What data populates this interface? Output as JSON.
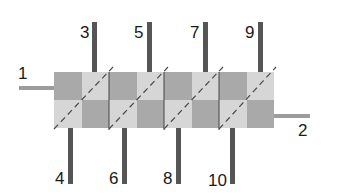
{
  "diagram": {
    "colors": {
      "dark_cell": "#a9a9a9",
      "light_cell": "#d6d6d6",
      "pin": "#555555",
      "lead": "#9c9c9c",
      "separator": "#444444",
      "dash": "#4a4a4a",
      "label": "#1a1a1a"
    },
    "blocks": [
      {
        "index": 1,
        "x": 54
      },
      {
        "index": 2,
        "x": 109
      },
      {
        "index": 3,
        "x": 164
      },
      {
        "index": 4,
        "x": 219
      }
    ],
    "leads": {
      "input": {
        "label": "1"
      },
      "output": {
        "label": "2"
      }
    },
    "top_pins": [
      {
        "label": "3"
      },
      {
        "label": "5"
      },
      {
        "label": "7"
      },
      {
        "label": "9"
      }
    ],
    "bottom_pins": [
      {
        "label": "4"
      },
      {
        "label": "6"
      },
      {
        "label": "8"
      },
      {
        "label": "10"
      }
    ]
  }
}
